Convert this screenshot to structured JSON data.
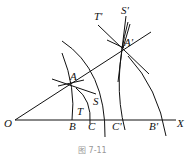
{
  "figure": {
    "caption": "图 7-11",
    "points": {
      "O": "O",
      "A": "A",
      "A_prime": "A'",
      "B": "B",
      "C": "C",
      "C_prime": "C'",
      "B_prime": "B'",
      "S": "S",
      "T": "T",
      "S_prime": "S'",
      "T_prime": "T'",
      "X": "X"
    },
    "stroke_color": "#111111",
    "background": "#ffffff"
  }
}
